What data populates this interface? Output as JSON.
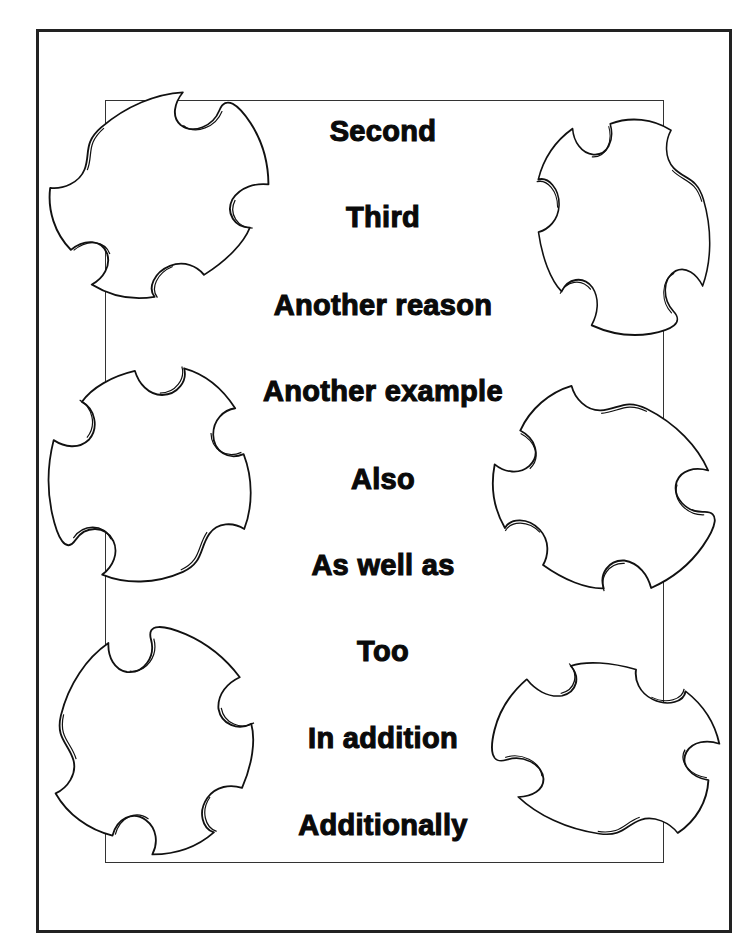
{
  "worksheet": {
    "words": [
      {
        "label": "Second",
        "y": 114
      },
      {
        "label": "Third",
        "y": 200
      },
      {
        "label": "Another reason",
        "y": 288
      },
      {
        "label": "Another example",
        "y": 374
      },
      {
        "label": "Also",
        "y": 462
      },
      {
        "label": "As well as",
        "y": 548
      },
      {
        "label": "Too",
        "y": 634
      },
      {
        "label": "In addition",
        "y": 721
      },
      {
        "label": "Additionally",
        "y": 808
      }
    ],
    "decorations": [
      "puzzle-piece-icon",
      "puzzle-piece-icon",
      "puzzle-piece-icon",
      "puzzle-piece-icon",
      "puzzle-piece-icon",
      "puzzle-piece-icon"
    ],
    "colors": {
      "ink": "#0a0a0a",
      "frame": "#222222",
      "paper": "#ffffff"
    }
  }
}
